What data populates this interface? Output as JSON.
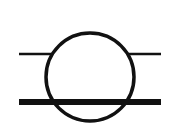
{
  "diagram": {
    "title": "Circle symbol between two horizontal lines",
    "colors": {
      "stroke": "#111111",
      "background": "#ffffff"
    },
    "circle": {
      "cx": 90,
      "cy": 77,
      "r": 44,
      "stroke_width": 3.5
    },
    "top_line": {
      "y": 54,
      "x1": 19,
      "x2": 161,
      "stroke_width": 2.5,
      "broken_by_circle": true
    },
    "bottom_line": {
      "y": 102,
      "x1": 19,
      "x2": 161,
      "stroke_width": 6,
      "passes_through_circle": true
    }
  }
}
